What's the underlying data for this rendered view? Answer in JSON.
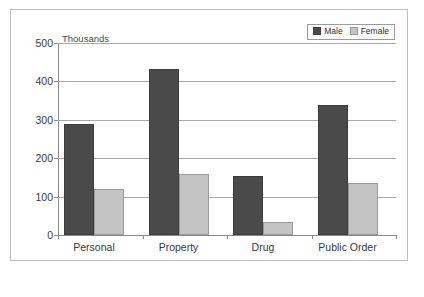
{
  "chart_data": {
    "type": "bar",
    "title": "",
    "subtitle": "",
    "units_label": "Thousands",
    "xlabel": "",
    "ylabel": "",
    "ylim": [
      0,
      500
    ],
    "yticks": [
      0,
      100,
      200,
      300,
      400,
      500
    ],
    "ytick_labels": [
      "0",
      "100",
      "200",
      "300",
      "400",
      "500"
    ],
    "grid": true,
    "legend_position": "top-right",
    "categories": [
      "Personal",
      "Property",
      "Drug",
      "Public Order"
    ],
    "series": [
      {
        "name": "Male",
        "color": "#4a4a4a",
        "values": [
          290,
          433,
          153,
          338
        ]
      },
      {
        "name": "Female",
        "color": "#c4c4c4",
        "values": [
          120,
          158,
          34,
          135
        ]
      }
    ]
  },
  "legend": {
    "entries": [
      {
        "label": "Male",
        "swatch": "male-swatch-icon"
      },
      {
        "label": "Female",
        "swatch": "female-swatch-icon"
      }
    ]
  },
  "colors": {
    "male": "#4a4a4a",
    "female": "#c4c4c4",
    "frame": "#bfbfbf",
    "axis": "#8a8a8a",
    "gridline": "#a8a8a8",
    "text": "#3a3a3a",
    "background": "#ffffff"
  }
}
